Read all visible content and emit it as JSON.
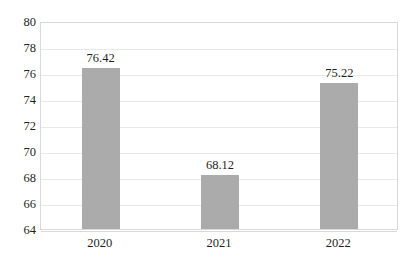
{
  "chart_data": {
    "type": "bar",
    "title": "",
    "subtitle": "",
    "xlabel": "",
    "ylabel": "",
    "categories": [
      "2020",
      "2021",
      "2022"
    ],
    "values": [
      76.42,
      68.12,
      75.22
    ],
    "data_labels": [
      "76.42",
      "68.12",
      "75.22"
    ],
    "ylim": [
      64,
      80
    ],
    "ytick_labels": [
      "80",
      "78",
      "76",
      "74",
      "72",
      "70",
      "68",
      "66",
      "64"
    ],
    "ytick_values": [
      80,
      78,
      76,
      74,
      72,
      70,
      68,
      66,
      64
    ],
    "grid": true,
    "grid_axis": "y",
    "legend": false,
    "legend_position": "none",
    "bar_color": "#ababab",
    "grid_color": "#e8e8e8",
    "axis_color": "#d9d9d9",
    "text_color": "#1f1f1f",
    "background_color": "#ffffff"
  }
}
